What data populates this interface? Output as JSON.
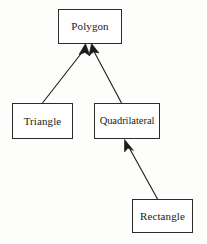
{
  "diagram": {
    "type": "class-inheritance-diagram",
    "background_color": "#fdfdfb",
    "node_fill_color": "#ffffff",
    "node_border_color": "#2b2b2b",
    "edge_color": "#1a1a1a",
    "text_color": "#1a1a1a",
    "nodes": [
      {
        "id": "polygon",
        "label": "Polygon",
        "role": "superclass",
        "x": 58,
        "y": 9,
        "width": 64,
        "height": 35
      },
      {
        "id": "triangle",
        "label": "Triangle",
        "role": "subclass",
        "x": 12,
        "y": 103,
        "width": 61,
        "height": 36
      },
      {
        "id": "quadrilateral",
        "label": "Quadrilateral",
        "role": "subclass",
        "x": 94,
        "y": 103,
        "width": 66,
        "height": 36
      },
      {
        "id": "rectangle",
        "label": "Rectangle",
        "role": "subclass",
        "x": 132,
        "y": 199,
        "width": 61,
        "height": 34
      }
    ],
    "edges": [
      {
        "id": "triangle-to-polygon",
        "from": "triangle",
        "to": "polygon",
        "relation": "inherits-from",
        "arrowhead": "solid-filled-triangle"
      },
      {
        "id": "quadrilateral-to-polygon",
        "from": "quadrilateral",
        "to": "polygon",
        "relation": "inherits-from",
        "arrowhead": "solid-filled-triangle"
      },
      {
        "id": "rectangle-to-quadrilateral",
        "from": "rectangle",
        "to": "quadrilateral",
        "relation": "inherits-from",
        "arrowhead": "solid-filled-triangle"
      }
    ]
  }
}
